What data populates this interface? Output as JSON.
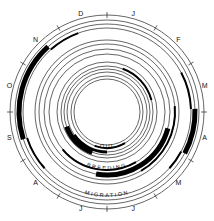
{
  "chart_data": {
    "type": "circular-annual-cycle",
    "title": "",
    "center": [
      107,
      112
    ],
    "months": [
      "J",
      "F",
      "M",
      "A",
      "M",
      "J",
      "J",
      "A",
      "S",
      "O",
      "N",
      "D"
    ],
    "month_label_radius": 101,
    "outer_ring_radius": 97,
    "rings": [
      {
        "name": "MIGRATION",
        "radius": 88,
        "label_radius": 85,
        "label_start_deg": 160,
        "label_end_deg": 200
      },
      {
        "name": "BREEDING",
        "radius": 63,
        "label_radius": 58,
        "label_start_deg": 160,
        "label_end_deg": 200
      },
      {
        "name": "MOULT",
        "radius": 40,
        "label_radius": 36,
        "label_start_deg": 165,
        "label_end_deg": 195
      }
    ],
    "guide_rings": [
      92,
      84,
      72,
      68,
      58,
      50,
      46,
      43,
      36,
      33
    ],
    "arcs": [
      {
        "ring": "MIGRATION",
        "radius": 88,
        "start_deg": 252,
        "end_deg": 318,
        "width": 5
      },
      {
        "ring": "MIGRATION",
        "radius": 84,
        "start_deg": 318,
        "end_deg": 340,
        "width": 2
      },
      {
        "ring": "MIGRATION",
        "radius": 84,
        "start_deg": 228,
        "end_deg": 252,
        "width": 2
      },
      {
        "ring": "MIGRATION",
        "radius": 88,
        "start_deg": 88,
        "end_deg": 118,
        "width": 5
      },
      {
        "ring": "MIGRATION",
        "radius": 84,
        "start_deg": 62,
        "end_deg": 88,
        "width": 2
      },
      {
        "ring": "MIGRATION",
        "radius": 84,
        "start_deg": 118,
        "end_deg": 132,
        "width": 2
      },
      {
        "ring": "BREEDING",
        "radius": 63,
        "start_deg": 105,
        "end_deg": 190,
        "width": 5
      },
      {
        "ring": "BREEDING",
        "radius": 68,
        "start_deg": 85,
        "end_deg": 150,
        "width": 2
      },
      {
        "ring": "BREEDING",
        "radius": 58,
        "start_deg": 150,
        "end_deg": 230,
        "width": 2
      },
      {
        "ring": "MOULT",
        "radius": 43,
        "start_deg": 200,
        "end_deg": 250,
        "width": 5
      },
      {
        "ring": "MOULT",
        "radius": 40,
        "start_deg": 180,
        "end_deg": 235,
        "width": 3
      },
      {
        "ring": "MOULT",
        "radius": 46,
        "start_deg": 20,
        "end_deg": 75,
        "width": 2
      },
      {
        "ring": "MOULT",
        "radius": 36,
        "start_deg": 150,
        "end_deg": 200,
        "width": 2
      }
    ]
  },
  "labels": {
    "migration": "MIGRATION",
    "breeding": "BREEDING",
    "moult": "MOULT"
  }
}
